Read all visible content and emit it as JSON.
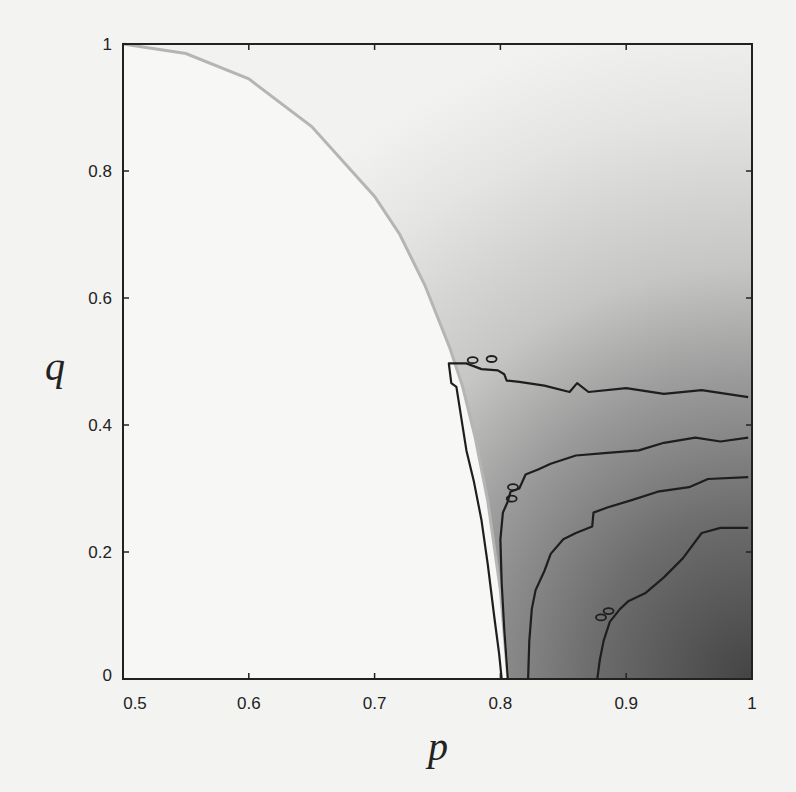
{
  "chart_data": {
    "type": "heatmap",
    "title": "",
    "xlabel": "p",
    "ylabel": "q",
    "xlim": [
      0.5,
      1
    ],
    "ylim": [
      0,
      1
    ],
    "x_ticks": [
      "0.5",
      "0.6",
      "0.7",
      "0.8",
      "0.9",
      "1"
    ],
    "y_ticks": [
      "0",
      "0.2",
      "0.4",
      "0.6",
      "0.8",
      "1"
    ],
    "grid": false,
    "legend": null,
    "boundary_curve": {
      "description": "Gray boundary curve from (0.5,1) to (~0.806,0); shaded region lies to its right",
      "color": "#b8b8b8",
      "points": [
        [
          0.5,
          1.0
        ],
        [
          0.55,
          0.985
        ],
        [
          0.6,
          0.945
        ],
        [
          0.65,
          0.87
        ],
        [
          0.7,
          0.76
        ],
        [
          0.72,
          0.7
        ],
        [
          0.74,
          0.62
        ],
        [
          0.76,
          0.52
        ],
        [
          0.77,
          0.46
        ],
        [
          0.78,
          0.38
        ],
        [
          0.79,
          0.28
        ],
        [
          0.8,
          0.14
        ],
        [
          0.806,
          0.0
        ]
      ]
    },
    "shading": {
      "description": "Grayscale intensity increasing toward p=1, q=0",
      "light_color": "#f0f0ee",
      "dark_color": "#4a4a4a"
    },
    "contours": [
      {
        "name": "contour-1",
        "points": [
          [
            0.997,
            0.444
          ],
          [
            0.96,
            0.455
          ],
          [
            0.93,
            0.449
          ],
          [
            0.9,
            0.458
          ],
          [
            0.87,
            0.452
          ],
          [
            0.861,
            0.466
          ],
          [
            0.855,
            0.452
          ],
          [
            0.835,
            0.462
          ],
          [
            0.815,
            0.468
          ],
          [
            0.805,
            0.47
          ],
          [
            0.803,
            0.48
          ],
          [
            0.798,
            0.486
          ],
          [
            0.785,
            0.488
          ],
          [
            0.773,
            0.497
          ],
          [
            0.759,
            0.497
          ],
          [
            0.761,
            0.466
          ],
          [
            0.765,
            0.46
          ],
          [
            0.769,
            0.41
          ],
          [
            0.773,
            0.36
          ],
          [
            0.779,
            0.31
          ],
          [
            0.785,
            0.25
          ],
          [
            0.79,
            0.18
          ],
          [
            0.795,
            0.1
          ],
          [
            0.799,
            0.04
          ],
          [
            0.801,
            0.0
          ]
        ]
      },
      {
        "name": "contour-2",
        "points": [
          [
            0.997,
            0.38
          ],
          [
            0.975,
            0.374
          ],
          [
            0.955,
            0.38
          ],
          [
            0.93,
            0.372
          ],
          [
            0.91,
            0.36
          ],
          [
            0.885,
            0.356
          ],
          [
            0.86,
            0.352
          ],
          [
            0.84,
            0.339
          ],
          [
            0.83,
            0.33
          ],
          [
            0.82,
            0.322
          ],
          [
            0.815,
            0.3
          ],
          [
            0.808,
            0.295
          ],
          [
            0.806,
            0.28
          ],
          [
            0.802,
            0.262
          ],
          [
            0.8,
            0.22
          ],
          [
            0.801,
            0.15
          ],
          [
            0.803,
            0.08
          ],
          [
            0.806,
            0.0
          ]
        ]
      },
      {
        "name": "contour-3",
        "points": [
          [
            0.997,
            0.318
          ],
          [
            0.965,
            0.315
          ],
          [
            0.95,
            0.302
          ],
          [
            0.925,
            0.295
          ],
          [
            0.905,
            0.282
          ],
          [
            0.885,
            0.27
          ],
          [
            0.874,
            0.262
          ],
          [
            0.873,
            0.24
          ],
          [
            0.86,
            0.23
          ],
          [
            0.85,
            0.22
          ],
          [
            0.84,
            0.197
          ],
          [
            0.835,
            0.17
          ],
          [
            0.828,
            0.14
          ],
          [
            0.825,
            0.11
          ],
          [
            0.823,
            0.06
          ],
          [
            0.822,
            0.0
          ]
        ]
      },
      {
        "name": "contour-4",
        "points": [
          [
            0.997,
            0.238
          ],
          [
            0.975,
            0.238
          ],
          [
            0.96,
            0.23
          ],
          [
            0.945,
            0.19
          ],
          [
            0.93,
            0.16
          ],
          [
            0.915,
            0.135
          ],
          [
            0.902,
            0.123
          ],
          [
            0.895,
            0.11
          ],
          [
            0.887,
            0.09
          ],
          [
            0.882,
            0.06
          ],
          [
            0.879,
            0.03
          ],
          [
            0.877,
            0.0
          ]
        ]
      }
    ],
    "small_islands": [
      [
        0.778,
        0.502
      ],
      [
        0.793,
        0.504
      ],
      [
        0.81,
        0.302
      ],
      [
        0.809,
        0.284
      ],
      [
        0.886,
        0.107
      ],
      [
        0.88,
        0.097
      ]
    ]
  }
}
